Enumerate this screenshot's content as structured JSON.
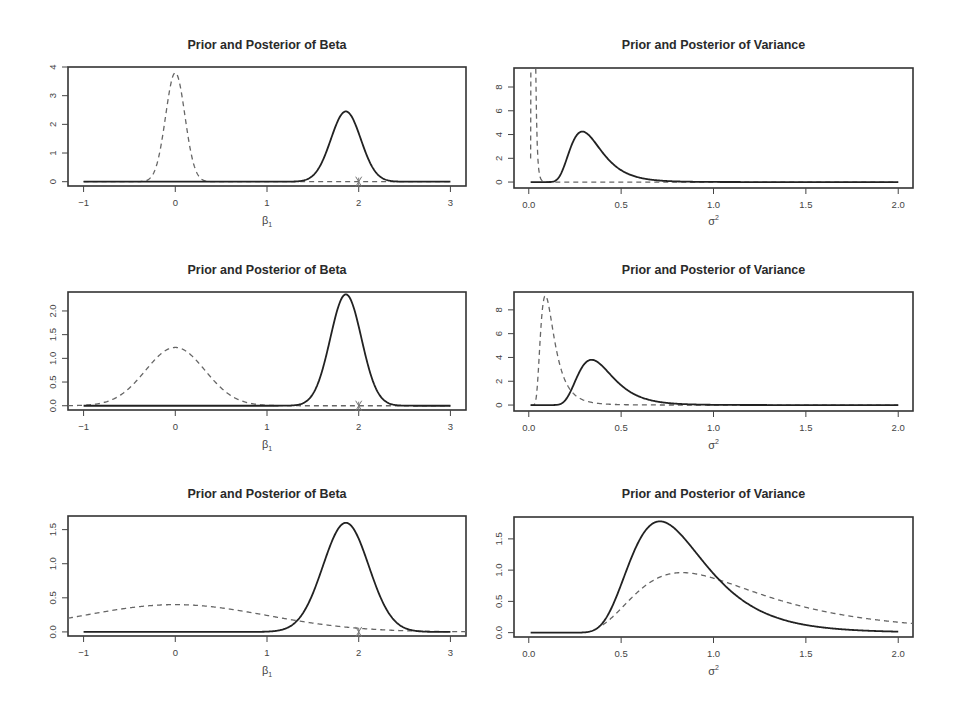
{
  "chart_data": [
    {
      "type": "line",
      "panel": "row1-left",
      "title": "Prior and Posterior of Beta",
      "xlabel": "β1",
      "ylabel": "",
      "xlim": [
        -1.17,
        3.17
      ],
      "ylim": [
        -0.15,
        4.0
      ],
      "xticks": [
        -1,
        0,
        1,
        2,
        3
      ],
      "yticks": [
        0,
        1,
        2,
        3,
        4
      ],
      "ytick_labels": [
        "0",
        "1",
        "2",
        "3",
        "4"
      ],
      "grid": false,
      "marker": {
        "x": 2,
        "label": "true value marker (x)"
      },
      "series": [
        {
          "name": "Prior",
          "style": "dashed",
          "dist": "normal",
          "mean": 0.0,
          "peak": 3.8,
          "x_range": [
            -1,
            3
          ]
        },
        {
          "name": "Posterior",
          "style": "solid",
          "dist": "normal",
          "mean": 1.86,
          "peak": 2.45,
          "x_range": [
            -1,
            3
          ]
        }
      ]
    },
    {
      "type": "line",
      "panel": "row1-right",
      "title": "Prior and Posterior of Variance",
      "xlabel": "σ²",
      "ylabel": "",
      "xlim": [
        -0.08,
        2.08
      ],
      "ylim": [
        -0.5,
        9.6
      ],
      "xticks": [
        0.0,
        0.5,
        1.0,
        1.5,
        2.0
      ],
      "xtick_labels": [
        "0.0",
        "0.5",
        "1.0",
        "1.5",
        "2.0"
      ],
      "yticks": [
        0,
        2,
        4,
        6,
        8
      ],
      "ytick_labels": [
        "0",
        "2",
        "4",
        "6",
        "8"
      ],
      "grid": false,
      "series": [
        {
          "name": "Prior",
          "style": "dashed",
          "dist": "invgamma",
          "mode": 0.02,
          "peak": 60,
          "x_range": [
            0.01,
            2.0
          ],
          "note": "spike near zero exceeding plot top"
        },
        {
          "name": "Posterior",
          "style": "solid",
          "dist": "invgamma",
          "mode": 0.29,
          "peak": 4.25,
          "x_range": [
            0.01,
            2.0
          ]
        }
      ]
    },
    {
      "type": "line",
      "panel": "row2-left",
      "title": "Prior and Posterior of Beta",
      "xlabel": "β1",
      "ylabel": "",
      "xlim": [
        -1.17,
        3.17
      ],
      "ylim": [
        -0.09,
        2.4
      ],
      "xticks": [
        -1,
        0,
        1,
        2,
        3
      ],
      "yticks": [
        0.0,
        0.5,
        1.0,
        1.5,
        2.0
      ],
      "ytick_labels": [
        "0.0",
        "0.5",
        "1.0",
        "1.5",
        "2.0"
      ],
      "grid": false,
      "marker": {
        "x": 2,
        "label": "true value marker (x)"
      },
      "series": [
        {
          "name": "Prior",
          "style": "dashed",
          "dist": "normal",
          "mean": 0.0,
          "peak": 1.23,
          "x_range": [
            -1.17,
            3
          ]
        },
        {
          "name": "Posterior",
          "style": "solid",
          "dist": "normal",
          "mean": 1.86,
          "peak": 2.35,
          "x_range": [
            -1,
            3
          ]
        }
      ]
    },
    {
      "type": "line",
      "panel": "row2-right",
      "title": "Prior and Posterior of Variance",
      "xlabel": "σ²",
      "ylabel": "",
      "xlim": [
        -0.08,
        2.08
      ],
      "ylim": [
        -0.5,
        9.5
      ],
      "xticks": [
        0.0,
        0.5,
        1.0,
        1.5,
        2.0
      ],
      "xtick_labels": [
        "0.0",
        "0.5",
        "1.0",
        "1.5",
        "2.0"
      ],
      "yticks": [
        0,
        2,
        4,
        6,
        8
      ],
      "ytick_labels": [
        "0",
        "2",
        "4",
        "6",
        "8"
      ],
      "grid": false,
      "series": [
        {
          "name": "Prior",
          "style": "dashed",
          "dist": "invgamma",
          "mode": 0.09,
          "peak": 9.2,
          "x_range": [
            0.01,
            2.0
          ]
        },
        {
          "name": "Posterior",
          "style": "solid",
          "dist": "invgamma",
          "mode": 0.34,
          "peak": 3.8,
          "x_range": [
            0.01,
            2.0
          ]
        }
      ]
    },
    {
      "type": "line",
      "panel": "row3-left",
      "title": "Prior and Posterior of Beta",
      "xlabel": "β1",
      "ylabel": "",
      "xlim": [
        -1.17,
        3.17
      ],
      "ylim": [
        -0.06,
        1.7
      ],
      "xticks": [
        -1,
        0,
        1,
        2,
        3
      ],
      "yticks": [
        0.0,
        0.5,
        1.0,
        1.5
      ],
      "ytick_labels": [
        "0.0",
        "0.5",
        "1.0",
        "1.5"
      ],
      "grid": false,
      "marker": {
        "x": 2,
        "label": "true value marker (x)"
      },
      "series": [
        {
          "name": "Prior",
          "style": "dashed",
          "dist": "normal",
          "mean": 0.0,
          "peak": 0.4,
          "x_range": [
            -1.17,
            3.17
          ]
        },
        {
          "name": "Posterior",
          "style": "solid",
          "dist": "normal",
          "mean": 1.86,
          "peak": 1.6,
          "x_range": [
            -1,
            3
          ]
        }
      ]
    },
    {
      "type": "line",
      "panel": "row3-right",
      "title": "Prior and Posterior of Variance",
      "xlabel": "σ²",
      "ylabel": "",
      "xlim": [
        -0.08,
        2.08
      ],
      "ylim": [
        -0.07,
        1.85
      ],
      "xticks": [
        0.0,
        0.5,
        1.0,
        1.5,
        2.0
      ],
      "xtick_labels": [
        "0.0",
        "0.5",
        "1.0",
        "1.5",
        "2.0"
      ],
      "yticks": [
        0.0,
        0.5,
        1.0,
        1.5
      ],
      "ytick_labels": [
        "0.0",
        "0.5",
        "1.0",
        "1.5"
      ],
      "grid": false,
      "series": [
        {
          "name": "Prior",
          "style": "dashed",
          "dist": "invgamma",
          "mode": 0.83,
          "peak": 0.96,
          "x_range": [
            0.4,
            2.08
          ]
        },
        {
          "name": "Posterior",
          "style": "solid",
          "dist": "invgamma",
          "mode": 0.71,
          "peak": 1.78,
          "x_range": [
            0.01,
            2.0
          ]
        }
      ]
    }
  ],
  "layout": {
    "panels": [
      {
        "box": [
          68,
          67,
          466,
          186
        ],
        "title_y": 46,
        "xlabel_y": 222
      },
      {
        "box": [
          514,
          68,
          913,
          188
        ],
        "title_y": 46,
        "xlabel_y": 222
      },
      {
        "box": [
          68,
          292,
          466,
          410
        ],
        "title_y": 271,
        "xlabel_y": 446
      },
      {
        "box": [
          514,
          292,
          913,
          411
        ],
        "title_y": 271,
        "xlabel_y": 446
      },
      {
        "box": [
          68,
          516,
          466,
          636
        ],
        "title_y": 495,
        "xlabel_y": 672
      },
      {
        "box": [
          514,
          517,
          913,
          637
        ],
        "title_y": 495,
        "xlabel_y": 672
      }
    ]
  }
}
